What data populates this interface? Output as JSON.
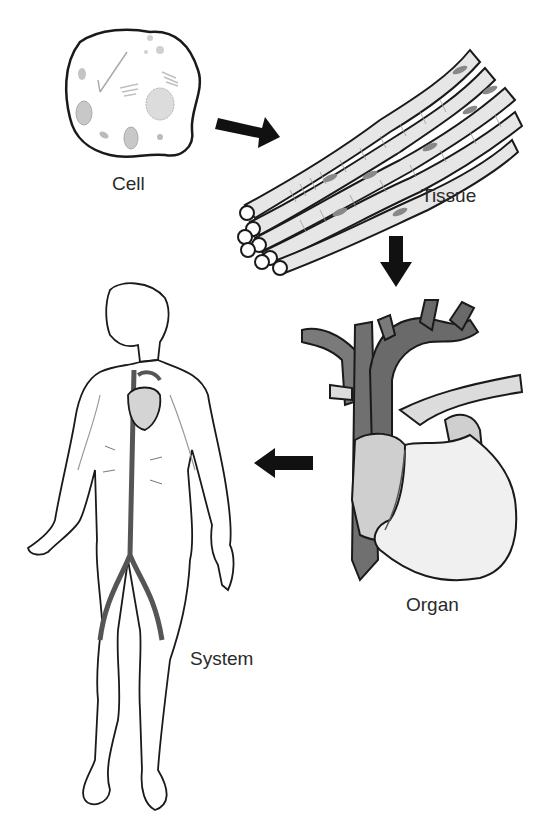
{
  "diagram": {
    "stages": [
      {
        "id": "cell",
        "label": "Cell",
        "icon": "cell-icon"
      },
      {
        "id": "tissue",
        "label": "Tissue",
        "icon": "muscle-tissue-icon"
      },
      {
        "id": "organ",
        "label": "Organ",
        "icon": "heart-icon"
      },
      {
        "id": "system",
        "label": "System",
        "icon": "human-circulatory-system-icon"
      }
    ],
    "arrows": [
      {
        "from": "cell",
        "to": "tissue",
        "direction": "down-right"
      },
      {
        "from": "tissue",
        "to": "organ",
        "direction": "down"
      },
      {
        "from": "organ",
        "to": "system",
        "direction": "left"
      }
    ],
    "colors": {
      "outline": "#1a1a1a",
      "dark_vessel": "#6e6e6e",
      "mid_gray": "#a8a8a8",
      "light_gray": "#d8d8d8",
      "pale": "#ececec",
      "arrow": "#111111"
    }
  }
}
